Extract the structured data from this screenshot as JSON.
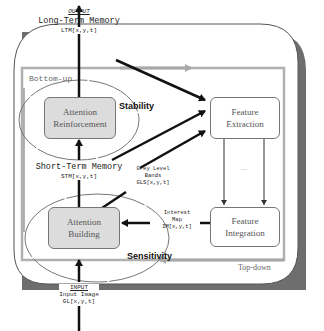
{
  "diagram": {
    "output": {
      "heading": "OUTPUT",
      "title": "Long-Term Memory",
      "var": "LTM[x,y,t]"
    },
    "input": {
      "heading": "INPUT",
      "title": "Input Image",
      "var": "GL[x,y,t]"
    },
    "stm": {
      "title": "Short-Term Memory",
      "var": "STM[x,y,t]"
    },
    "gls": {
      "line1": "Grey Level",
      "line2": "Bands",
      "var": "GLS[x,y,t]"
    },
    "interest_map": {
      "line1": "Interest",
      "line2": "Map",
      "var": "IM[x,y,t]"
    },
    "nodes": {
      "attention_reinforcement": {
        "line1": "Attention",
        "line2": "Reinforcement"
      },
      "attention_building": {
        "line1": "Attention",
        "line2": "Building"
      },
      "feature_extraction": {
        "line1": "Feature",
        "line2": "Extraction"
      },
      "feature_integration": {
        "line1": "Feature",
        "line2": "Integration"
      }
    },
    "labels": {
      "bottom_up": "Bottom-up",
      "top_down": "Top-down",
      "stability": "Stability",
      "sensitivity": "Sensitivity",
      "ellipsis": "..."
    },
    "colors": {
      "shadow": "#6e6e6e",
      "grey_arrow": "#a8a8a8",
      "node_fill": "#dcdcdc",
      "line": "#111111"
    }
  }
}
